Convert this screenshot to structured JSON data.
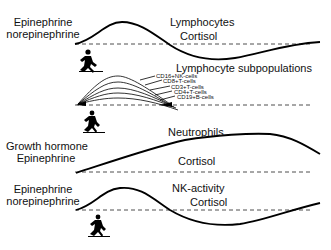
{
  "panels": [
    {
      "left_label": [
        "Epinephrine",
        "norepinephrine"
      ],
      "curve_label": "Lymphocytes",
      "baseline_label": "Cortisol"
    },
    {
      "title": "Lymphocyte subpopulations",
      "subsets": [
        "CD16+NK-cells",
        "CD8+T-cells",
        "CD3+T-cells",
        "CD4+T-cells",
        "CD19+B-cells"
      ]
    },
    {
      "left_label": [
        "Growth hormone",
        "Epinephrine"
      ],
      "curve_label": "Neutrophils",
      "baseline_label": "Cortisol"
    },
    {
      "left_label": [
        "Epinephrine",
        "norepinephrine"
      ],
      "curve_label": "NK-activity",
      "baseline_label": "Cortisol"
    }
  ],
  "icons": [
    "runner-icon",
    "runner-icon",
    "runner-icon",
    "runner-icon"
  ]
}
